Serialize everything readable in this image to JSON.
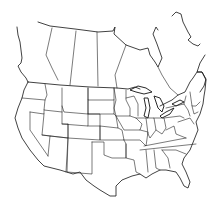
{
  "map": {
    "type": "outline-map",
    "region": "United States (contiguous) and southern Canada",
    "style": "black outlines on white, no labels",
    "background_color": "#ffffff",
    "line_color": "#222222",
    "labels": []
  }
}
